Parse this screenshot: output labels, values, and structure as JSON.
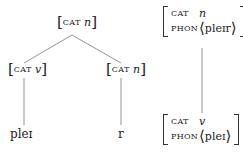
{
  "left_tree": {
    "root": {
      "feature": "CAT",
      "value": "n"
    },
    "left_child": {
      "feature": "CAT",
      "value": "v",
      "leaf": "pleɪ"
    },
    "right_child": {
      "feature": "CAT",
      "value": "n",
      "leaf": "r"
    }
  },
  "right_tree": {
    "top": {
      "cat_feature": "CAT",
      "cat_value": "n",
      "phon_feature": "PHON",
      "phon_value": "pleɪr"
    },
    "bottom": {
      "cat_feature": "CAT",
      "cat_value": "v",
      "phon_feature": "PHON",
      "phon_value": "pleɪ"
    }
  }
}
